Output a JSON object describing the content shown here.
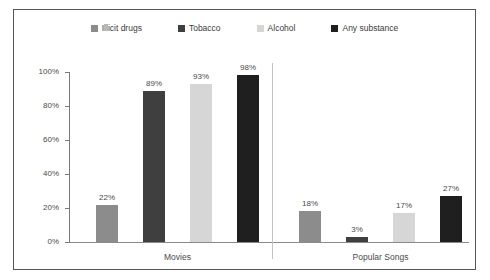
{
  "chart_data": {
    "type": "bar",
    "title": "",
    "xlabel": "",
    "ylabel": "",
    "ylim": [
      0,
      100
    ],
    "ytick_labels": [
      "0%",
      "20%",
      "40%",
      "60%",
      "80%",
      "100%"
    ],
    "ytick_values": [
      0,
      20,
      40,
      60,
      80,
      100
    ],
    "grid": false,
    "legend_position": "top",
    "categories": [
      "Movies",
      "Popular Songs"
    ],
    "series": [
      {
        "name": "Illicit drugs",
        "color": "#8c8c8c",
        "values": [
          22,
          18
        ],
        "labels": [
          "22%",
          "18%"
        ]
      },
      {
        "name": "Tobacco",
        "color": "#3f3f3f",
        "values": [
          89,
          3
        ],
        "labels": [
          "89%",
          "3%"
        ]
      },
      {
        "name": "Alcohol",
        "color": "#d6d6d6",
        "values": [
          93,
          17
        ],
        "labels": [
          "93%",
          "17%"
        ]
      },
      {
        "name": "Any substance",
        "color": "#1f1f1f",
        "values": [
          98,
          27
        ],
        "labels": [
          "98%",
          "27%"
        ]
      }
    ]
  },
  "legend": {
    "items": [
      {
        "label": "Illicit drugs",
        "color": "#8c8c8c"
      },
      {
        "label": "Tobacco",
        "color": "#3f3f3f"
      },
      {
        "label": "Alcohol",
        "color": "#d6d6d6"
      },
      {
        "label": "Any substance",
        "color": "#1f1f1f"
      }
    ]
  },
  "axis": {
    "ticks": [
      {
        "label": "100%",
        "value": 100
      },
      {
        "label": "80%",
        "value": 80
      },
      {
        "label": "60%",
        "value": 60
      },
      {
        "label": "40%",
        "value": 40
      },
      {
        "label": "20%",
        "value": 20
      },
      {
        "label": "0%",
        "value": 0
      }
    ]
  },
  "groups": [
    {
      "label": "Movies"
    },
    {
      "label": "Popular Songs"
    }
  ],
  "colors": {
    "frame_border": "#555555",
    "axis": "#7a7a7a",
    "baseline": "#8a8a8a",
    "divider": "#c3c3c3",
    "text": "#4a4a4a",
    "background": "#ffffff"
  }
}
